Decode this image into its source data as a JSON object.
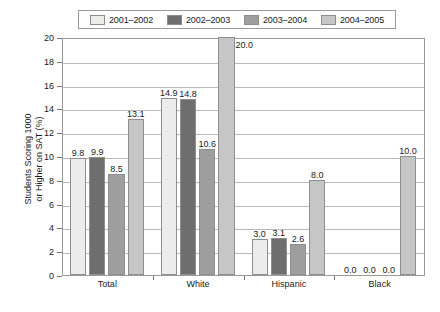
{
  "chart_data": {
    "type": "bar",
    "title": "",
    "xlabel": "",
    "ylabel": "Students Scoring 1000\nor Higher on SAT (%)",
    "ylim": [
      0,
      20
    ],
    "ytick_step": 2,
    "yticks": [
      "20",
      "18",
      "16",
      "14",
      "12",
      "10",
      "8",
      "6",
      "4",
      "2",
      "0"
    ],
    "grid": "horizontal",
    "legend_position": "top",
    "categories": [
      "Total",
      "White",
      "Hispanic",
      "Black"
    ],
    "series": [
      {
        "name": "2001–2002",
        "color": "#ececec",
        "values": [
          9.8,
          14.9,
          3.0,
          0.0
        ],
        "labels": [
          "9.8",
          "14.9",
          "3.0",
          "0.0"
        ]
      },
      {
        "name": "2002–2003",
        "color": "#6e6e6e",
        "values": [
          9.9,
          14.8,
          3.1,
          0.0
        ],
        "labels": [
          "9.9",
          "14.8",
          "3.1",
          "0.0"
        ]
      },
      {
        "name": "2003–2004",
        "color": "#9e9e9e",
        "values": [
          8.5,
          10.6,
          2.6,
          0.0
        ],
        "labels": [
          "8.5",
          "10.6",
          "2.6",
          "0.0"
        ]
      },
      {
        "name": "2004–2005",
        "color": "#c6c6c6",
        "values": [
          13.1,
          20.0,
          8.0,
          10.0
        ],
        "labels": [
          "13.1",
          "20.0",
          "8.0",
          "10.0"
        ]
      }
    ]
  }
}
